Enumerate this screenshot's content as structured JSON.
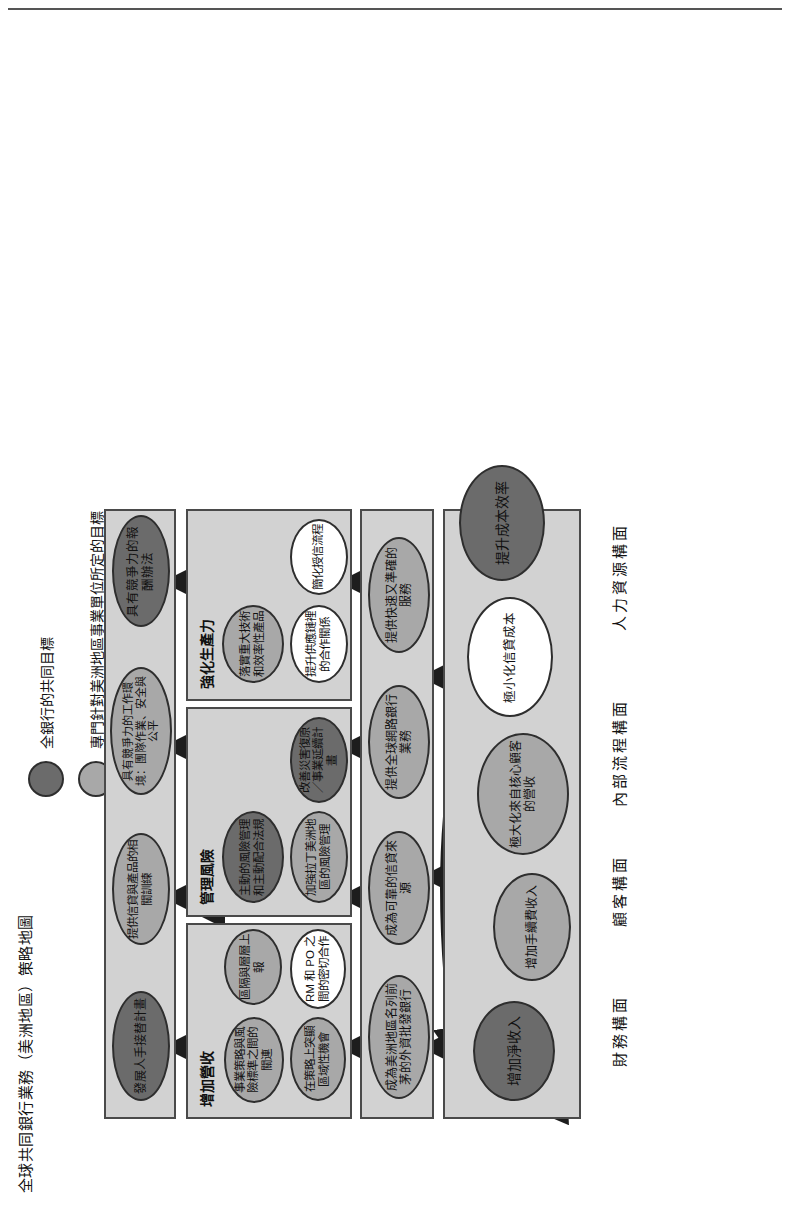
{
  "title": "全球共同銀行業務（美洲地區）策略地圖",
  "legend": {
    "items": [
      {
        "color": "#6b6b6b",
        "label": "全銀行的共同目標"
      },
      {
        "color": "#a8a8a8",
        "label": "專門針對美洲地區事業單位所定的目標"
      },
      {
        "color": "#ffffff",
        "label": "已經決定好的分攤目標"
      }
    ]
  },
  "perspectives": [
    {
      "key": "financial",
      "label": "財務構面"
    },
    {
      "key": "customer",
      "label": "顧客構面"
    },
    {
      "key": "process",
      "label": "內部流程構面"
    },
    {
      "key": "hr",
      "label": "人力資源構面"
    }
  ],
  "financial": {
    "hub": {
      "text": "增加淨收入",
      "tone": "dark"
    },
    "objectives": [
      {
        "text": "增加手續費收入",
        "tone": "mid"
      },
      {
        "text": "極大化來自核心顧客的營收",
        "tone": "mid"
      },
      {
        "text": "極小化信貸成本",
        "tone": "light"
      },
      {
        "text": "提升成本效率",
        "tone": "dark"
      }
    ]
  },
  "customer": {
    "objectives": [
      {
        "text": "成為美洲地區名列前茅的外資批發銀行",
        "tone": "mid"
      },
      {
        "text": "成為可靠的信貸來源",
        "tone": "mid"
      },
      {
        "text": "提供全球網路銀行業務",
        "tone": "mid"
      },
      {
        "text": "提供快速又準確的服務",
        "tone": "mid"
      }
    ]
  },
  "process": {
    "groups": [
      {
        "title": "增加營收",
        "objectives": [
          {
            "text": "區隔與層層上報",
            "tone": "mid"
          },
          {
            "text": "RM 和 PO 之間的密切合作",
            "tone": "light"
          },
          {
            "text": "在策略上突顯區域性機會",
            "tone": "mid"
          },
          {
            "text": "事業策略與風險標準之間的關連",
            "tone": "mid"
          }
        ]
      },
      {
        "title": "管理風險",
        "objectives": [
          {
            "text": "改善災害復原／事業延續計畫",
            "tone": "dark"
          },
          {
            "text": "加強拉丁美洲地區的風險管理",
            "tone": "mid"
          },
          {
            "text": "主動的風險管理和主動配合法規",
            "tone": "dark"
          }
        ]
      },
      {
        "title": "強化生產力",
        "objectives": [
          {
            "text": "簡化授信流程",
            "tone": "light"
          },
          {
            "text": "提升供應鏈裡的合作關係",
            "tone": "light"
          },
          {
            "text": "落實重大技術和效率性產品",
            "tone": "mid"
          }
        ]
      }
    ]
  },
  "hr": {
    "objectives": [
      {
        "text": "發展人手接替計畫",
        "tone": "dark"
      },
      {
        "text": "提供信貸與產品的相關訓練",
        "tone": "mid"
      },
      {
        "text": "具有競爭力的工作環境：團隊作業、安全與公平",
        "tone": "mid"
      },
      {
        "text": "具有競爭力的報酬辦法",
        "tone": "dark"
      }
    ]
  }
}
